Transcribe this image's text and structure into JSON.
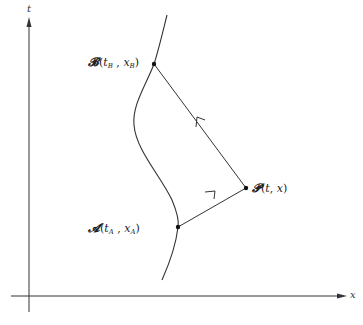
{
  "diagram": {
    "axes": {
      "vertical_label": "t",
      "horizontal_label": "x"
    },
    "points": {
      "B": {
        "symbol": "𝓑",
        "open": "(",
        "t": "t",
        "t_sub": "B",
        "sep": " , ",
        "x": "x",
        "x_sub": "B",
        "close": ")"
      },
      "P": {
        "symbol": "𝓟",
        "open": "(",
        "t": "t",
        "sep": ", ",
        "x": "x",
        "close": ")"
      },
      "A": {
        "symbol": "𝓐",
        "open": "(",
        "t": "t",
        "t_sub": "A",
        "sep": " , ",
        "x": "x",
        "x_sub": "A",
        "close": ")"
      }
    },
    "colors": {
      "stroke": "#333333",
      "background": "#ffffff"
    }
  }
}
